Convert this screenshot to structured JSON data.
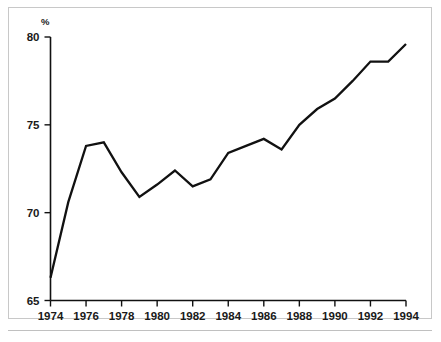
{
  "chart_data": {
    "type": "line",
    "title": "",
    "subtitle": "",
    "xlabel": "",
    "ylabel": "%",
    "yunit_label": "%",
    "xlim": [
      1974,
      1994
    ],
    "ylim": [
      65,
      80
    ],
    "grid": false,
    "legend": null,
    "x": [
      1974,
      1975,
      1976,
      1977,
      1978,
      1979,
      1980,
      1981,
      1982,
      1983,
      1984,
      1985,
      1986,
      1987,
      1988,
      1989,
      1990,
      1991,
      1992,
      1993,
      1994
    ],
    "values": [
      66.3,
      70.6,
      73.8,
      74.0,
      72.3,
      70.9,
      71.6,
      72.4,
      71.5,
      71.9,
      73.4,
      73.8,
      74.2,
      73.6,
      75.0,
      75.9,
      76.5,
      77.5,
      78.6,
      78.6,
      79.6
    ],
    "series": [
      {
        "name": "series-1",
        "values": [
          66.3,
          70.6,
          73.8,
          74.0,
          72.3,
          70.9,
          71.6,
          72.4,
          71.5,
          71.9,
          73.4,
          73.8,
          74.2,
          73.6,
          75.0,
          75.9,
          76.5,
          77.5,
          78.6,
          78.6,
          79.6
        ]
      }
    ],
    "y_ticks": [
      65,
      70,
      75,
      80
    ],
    "y_tick_labels": [
      "65",
      "70",
      "75",
      "80"
    ],
    "x_ticks": [
      1974,
      1976,
      1978,
      1980,
      1982,
      1984,
      1986,
      1988,
      1990,
      1992,
      1994
    ],
    "x_tick_labels": [
      "1974",
      "1976",
      "1978",
      "1980",
      "1982",
      "1984",
      "1986",
      "1988",
      "1990",
      "1992",
      "1994"
    ],
    "line_color": "#111111",
    "background_color": "#ffffff",
    "frame_color": "#c8c8c8"
  }
}
